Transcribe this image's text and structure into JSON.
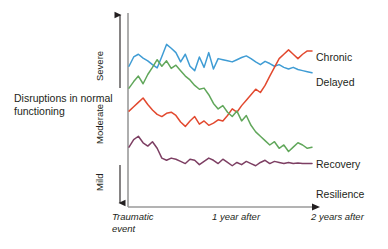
{
  "chart_data": {
    "type": "line",
    "title": "",
    "ylabel": "Disruptions in\nnormal functioning",
    "xlabel": "",
    "grid": false,
    "legend_position": "right-inline",
    "yticks": [
      "Severe",
      "Moderate",
      "Mild"
    ],
    "xticks": [
      "Traumatic\nevent",
      "1 year after",
      "2 years after"
    ],
    "xlim": [
      0,
      2
    ],
    "ylim": [
      0,
      3
    ],
    "x": [
      0.0,
      0.05,
      0.1,
      0.15,
      0.2,
      0.25,
      0.3,
      0.35,
      0.4,
      0.45,
      0.5,
      0.55,
      0.6,
      0.65,
      0.7,
      0.75,
      0.8,
      0.85,
      0.9,
      0.95,
      1.0,
      1.05,
      1.1,
      1.15,
      1.2,
      1.25,
      1.3,
      1.35,
      1.4,
      1.45,
      1.5,
      1.55,
      1.6,
      1.65,
      1.7,
      1.75,
      1.8,
      1.85,
      1.9,
      1.95
    ],
    "series": [
      {
        "name": "Chronic",
        "color": "#3f9cd4",
        "label_color": "#231f20",
        "values": [
          2.3,
          2.47,
          2.52,
          2.45,
          2.4,
          2.33,
          2.27,
          2.48,
          2.7,
          2.63,
          2.55,
          2.38,
          2.52,
          2.3,
          2.22,
          2.47,
          2.28,
          2.55,
          2.25,
          2.44,
          2.42,
          2.4,
          2.38,
          2.42,
          2.46,
          2.49,
          2.44,
          2.38,
          2.33,
          2.39,
          2.35,
          2.3,
          2.33,
          2.28,
          2.25,
          2.28,
          2.24,
          2.22,
          2.2,
          2.18
        ]
      },
      {
        "name": "Delayed",
        "color": "#e2492f",
        "label_color": "#231f20",
        "values": [
          1.48,
          1.56,
          1.64,
          1.72,
          1.6,
          1.5,
          1.42,
          1.38,
          1.44,
          1.46,
          1.4,
          1.28,
          1.2,
          1.3,
          1.38,
          1.24,
          1.3,
          1.22,
          1.26,
          1.32,
          1.3,
          1.4,
          1.52,
          1.46,
          1.58,
          1.68,
          1.78,
          1.88,
          1.82,
          1.95,
          2.12,
          2.28,
          2.44,
          2.52,
          2.6,
          2.52,
          2.44,
          2.52,
          2.58,
          2.58
        ]
      },
      {
        "name": "Recovery",
        "color": "#61a75b",
        "label_color": "#231f20",
        "values": [
          1.9,
          2.02,
          2.12,
          1.98,
          2.15,
          2.28,
          2.42,
          2.3,
          2.4,
          2.26,
          2.32,
          2.22,
          2.12,
          2.05,
          1.95,
          1.88,
          1.9,
          1.78,
          1.62,
          1.52,
          1.58,
          1.46,
          1.38,
          1.48,
          1.3,
          1.4,
          1.22,
          1.1,
          1.02,
          0.94,
          0.86,
          0.92,
          0.8,
          0.86,
          0.74,
          0.82,
          0.9,
          0.86,
          0.8,
          0.82
        ]
      },
      {
        "name": "Resilience",
        "color": "#7d3f63",
        "label_color": "#231f20",
        "values": [
          0.82,
          0.96,
          1.02,
          0.9,
          0.84,
          0.92,
          0.8,
          0.62,
          0.58,
          0.62,
          0.6,
          0.56,
          0.52,
          0.6,
          0.58,
          0.5,
          0.56,
          0.62,
          0.58,
          0.52,
          0.6,
          0.54,
          0.48,
          0.54,
          0.5,
          0.56,
          0.52,
          0.48,
          0.54,
          0.58,
          0.52,
          0.56,
          0.54,
          0.52,
          0.54,
          0.52,
          0.53,
          0.52,
          0.52,
          0.52
        ]
      }
    ],
    "axis_color": "#8d8d8d",
    "arrow_color": "#231f20"
  },
  "labels": {
    "axis_title": "Disruptions in\nnormal functioning",
    "ytick_severe": "Severe",
    "ytick_moderate": "Moderate",
    "ytick_mild": "Mild",
    "xtick_traumatic": "Traumatic\nevent",
    "xtick_one_year": "1 year after",
    "xtick_two_years": "2 years after",
    "series_chronic": "Chronic",
    "series_delayed": "Delayed",
    "series_recovery": "Recovery",
    "series_resilience": "Resilience"
  }
}
